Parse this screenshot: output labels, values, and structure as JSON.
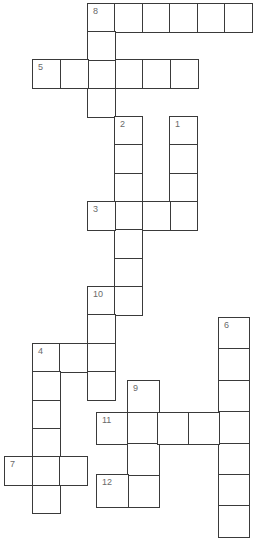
{
  "puzzle": {
    "type": "crossword",
    "border_color": "#3a3a3a",
    "number_color": "#6a6a6a",
    "entries": [
      {
        "number": "8",
        "direction": "across",
        "x": 87,
        "y": 3,
        "length": 6,
        "cell_w": 27.4,
        "cell_h": 28.3
      },
      {
        "number": "8",
        "direction": "down",
        "x": 87,
        "y": 3,
        "length": 4,
        "cell_w": 27.4,
        "cell_h": 28.3
      },
      {
        "number": "5",
        "direction": "across",
        "x": 32,
        "y": 59,
        "length": 6,
        "cell_w": 27.5,
        "cell_h": 28.5
      },
      {
        "number": "2",
        "direction": "down",
        "x": 114,
        "y": 116,
        "length": 7,
        "cell_w": 27.4,
        "cell_h": 28.3
      },
      {
        "number": "1",
        "direction": "down",
        "x": 169,
        "y": 116,
        "length": 4,
        "cell_w": 27.4,
        "cell_h": 28.3
      },
      {
        "number": "3",
        "direction": "across",
        "x": 87,
        "y": 201,
        "length": 4,
        "cell_w": 27.4,
        "cell_h": 28.3
      },
      {
        "number": "10",
        "direction": "across",
        "x": 87,
        "y": 286,
        "length": 2,
        "cell_w": 27.4,
        "cell_h": 28.3
      },
      {
        "number": "10",
        "direction": "down",
        "x": 87,
        "y": 286,
        "length": 4,
        "cell_w": 27.4,
        "cell_h": 28.3
      },
      {
        "number": "4",
        "direction": "across",
        "x": 32,
        "y": 343,
        "length": 3,
        "cell_w": 27.4,
        "cell_h": 28.3
      },
      {
        "number": "4",
        "direction": "down",
        "x": 32,
        "y": 343,
        "length": 6,
        "cell_w": 27.4,
        "cell_h": 28.3
      },
      {
        "number": "7",
        "direction": "across",
        "x": 4,
        "y": 456,
        "length": 3,
        "cell_w": 27.4,
        "cell_h": 28.3
      },
      {
        "number": "6",
        "direction": "down",
        "x": 218,
        "y": 317,
        "length": 7,
        "cell_w": 30.5,
        "cell_h": 31.4
      },
      {
        "number": "9",
        "direction": "down",
        "x": 127,
        "y": 380,
        "length": 4,
        "cell_w": 31,
        "cell_h": 31.5
      },
      {
        "number": "11",
        "direction": "across",
        "x": 96,
        "y": 412,
        "length": 5,
        "cell_w": 30.5,
        "cell_h": 31.3
      },
      {
        "number": "12",
        "direction": "across",
        "x": 96,
        "y": 474,
        "length": 2,
        "cell_w": 31,
        "cell_h": 32
      }
    ]
  }
}
